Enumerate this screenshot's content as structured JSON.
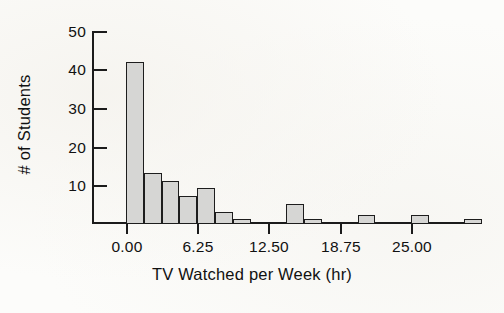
{
  "chart_data": {
    "type": "bar",
    "title": "",
    "subtitle": "",
    "xlabel": "TV Watched per Week (hr)",
    "ylabel": "# of Students",
    "grid": false,
    "legend": false,
    "xlim": [
      -1.5,
      32.0
    ],
    "ylim": [
      0,
      50
    ],
    "xtick_labels": [
      "0.00",
      "6.25",
      "12.50",
      "18.75",
      "25.00"
    ],
    "xtick_values": [
      0.0,
      6.25,
      12.5,
      18.75,
      25.0
    ],
    "ytick_labels": [
      "10",
      "20",
      "30",
      "40",
      "50"
    ],
    "ytick_values": [
      10,
      20,
      30,
      40,
      50
    ],
    "bin_width": 1.5625,
    "bins": [
      {
        "x_start": 0.0,
        "x_end": 1.5625,
        "value": 42
      },
      {
        "x_start": 1.5625,
        "x_end": 3.125,
        "value": 13
      },
      {
        "x_start": 3.125,
        "x_end": 4.6875,
        "value": 11
      },
      {
        "x_start": 4.6875,
        "x_end": 6.25,
        "value": 7
      },
      {
        "x_start": 6.25,
        "x_end": 7.8125,
        "value": 9
      },
      {
        "x_start": 7.8125,
        "x_end": 9.375,
        "value": 3
      },
      {
        "x_start": 9.375,
        "x_end": 10.9375,
        "value": 1
      },
      {
        "x_start": 10.9375,
        "x_end": 12.5,
        "value": 0
      },
      {
        "x_start": 12.5,
        "x_end": 14.0625,
        "value": 0
      },
      {
        "x_start": 14.0625,
        "x_end": 15.625,
        "value": 0
      },
      {
        "x_start": 15.625,
        "x_end": 17.1875,
        "value": 0
      },
      {
        "x_start": 17.1875,
        "x_end": 18.75,
        "value": 0
      }
    ],
    "bars_drawn": [
      {
        "x_start": 0.0,
        "x_end": 1.5625,
        "value": 42
      },
      {
        "x_start": 1.5625,
        "x_end": 3.125,
        "value": 13
      },
      {
        "x_start": 3.125,
        "x_end": 4.6875,
        "value": 11
      },
      {
        "x_start": 4.6875,
        "x_end": 6.25,
        "value": 7
      },
      {
        "x_start": 6.25,
        "x_end": 7.8125,
        "value": 9
      },
      {
        "x_start": 7.8125,
        "x_end": 9.375,
        "value": 3
      },
      {
        "x_start": 9.375,
        "x_end": 10.9375,
        "value": 1
      },
      {
        "x_start": 14.0625,
        "x_end": 15.625,
        "value": 5
      },
      {
        "x_start": 15.625,
        "x_end": 17.1875,
        "value": 1
      },
      {
        "x_start": 20.3125,
        "x_end": 21.875,
        "value": 2
      },
      {
        "x_start": 25.0,
        "x_end": 26.5625,
        "value": 2
      },
      {
        "x_start": 29.6875,
        "x_end": 31.25,
        "value": 1
      }
    ],
    "colors": {
      "bar_fill": "#d6d6d4",
      "bar_stroke": "#1d1d1d",
      "axis": "#1b1b1b",
      "text": "#111111",
      "background": "#fcfcfa"
    }
  }
}
